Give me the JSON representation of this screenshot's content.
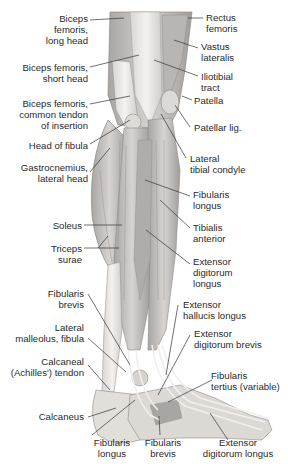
{
  "figure": {
    "labels_left": [
      {
        "id": "biceps-long",
        "text": "Biceps\nfemoris,\nlong head"
      },
      {
        "id": "biceps-short",
        "text": "Biceps femoris,\nshort head"
      },
      {
        "id": "biceps-common",
        "text": "Biceps femoris,\ncommon tendon\nof insertion"
      },
      {
        "id": "head-fibula",
        "text": "Head of fibula"
      },
      {
        "id": "gastro-lateral",
        "text": "Gastrocnemius,\nlateral head"
      },
      {
        "id": "soleus",
        "text": "Soleus"
      },
      {
        "id": "triceps-surae",
        "text": "Triceps\nsurae"
      },
      {
        "id": "fibularis-brevis-upper",
        "text": "Fibularis\nbrevis"
      },
      {
        "id": "lateral-malleolus",
        "text": "Lateral\nmalleolus, fibula"
      },
      {
        "id": "calcaneal-tendon",
        "text": "Calcaneal\n(Achilles') tendon"
      },
      {
        "id": "calcaneus",
        "text": "Calcaneus"
      }
    ],
    "labels_right": [
      {
        "id": "rectus-femoris",
        "text": "Rectus\nfemoris"
      },
      {
        "id": "vastus-lateralis",
        "text": "Vastus\nlateralis"
      },
      {
        "id": "iliotibial-tract",
        "text": "Iliotibial\ntract"
      },
      {
        "id": "patella",
        "text": "Patella"
      },
      {
        "id": "patellar-lig",
        "text": "Patellar lig."
      },
      {
        "id": "lateral-tibial-condyle",
        "text": "Lateral\ntibial condyle"
      },
      {
        "id": "fibularis-longus-upper",
        "text": "Fibularis\nlongus"
      },
      {
        "id": "tibialis-anterior",
        "text": "Tibialis\nanterior"
      },
      {
        "id": "ext-digitorum-longus-upper",
        "text": "Extensor\ndigitorum\nlongus"
      },
      {
        "id": "ext-hallucis-longus",
        "text": "Extensor\nhallucis longus"
      },
      {
        "id": "ext-digitorum-brevis",
        "text": "Extensor\ndigitorum brevis"
      },
      {
        "id": "fibularis-tertius",
        "text": "Fibularis\ntertius (variable)"
      }
    ],
    "labels_bottom": [
      {
        "id": "fibularis-longus-lower",
        "text": "Fibularis\nlongus"
      },
      {
        "id": "fibularis-brevis-lower",
        "text": "Fibularis\nbrevis"
      },
      {
        "id": "ext-digitorum-longus-lower",
        "text": "Extensor\ndigitorum longus"
      }
    ],
    "colors": {
      "label_text": "#2a2a2a",
      "leader_line": "#333333",
      "muscle_fill": "#c9c6c4",
      "muscle_dark": "#8e8a88",
      "tendon_fill": "#eceae8",
      "bone_fill": "#e2dfdb",
      "background": "#ffffff"
    }
  }
}
